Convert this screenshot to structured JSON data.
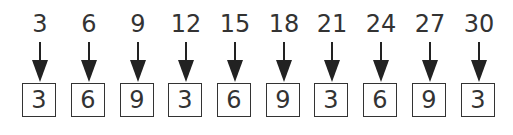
{
  "diagram": {
    "columns": [
      {
        "input": "3",
        "output": "3"
      },
      {
        "input": "6",
        "output": "6"
      },
      {
        "input": "9",
        "output": "9"
      },
      {
        "input": "12",
        "output": "3"
      },
      {
        "input": "15",
        "output": "6"
      },
      {
        "input": "18",
        "output": "9"
      },
      {
        "input": "21",
        "output": "3"
      },
      {
        "input": "24",
        "output": "6"
      },
      {
        "input": "27",
        "output": "9"
      },
      {
        "input": "30",
        "output": "3"
      }
    ]
  }
}
